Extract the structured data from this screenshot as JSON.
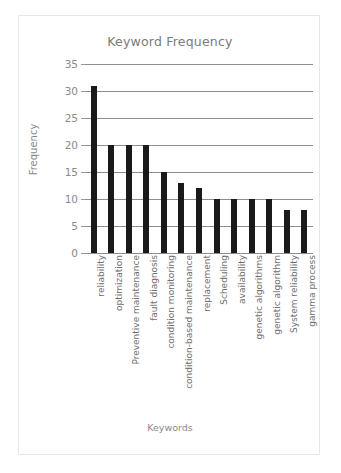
{
  "chart_data": {
    "type": "bar",
    "title": "Keyword Frequency",
    "xlabel": "Keywords",
    "ylabel": "Frequency",
    "categories": [
      "reliability",
      "optimization",
      "Preventive maintenance",
      "fault diagnosis",
      "condition monitoring",
      "condition-based maintenance",
      "replacement",
      "Scheduling",
      "availability",
      "genetic algorithms",
      "genetic algorithm",
      "System reliability",
      "gamma process"
    ],
    "values": [
      31,
      20,
      20,
      20,
      15,
      13,
      12,
      10,
      10,
      10,
      10,
      8,
      8
    ],
    "ylim": [
      0,
      35
    ],
    "yticks": [
      0,
      5,
      10,
      15,
      20,
      25,
      30,
      35
    ],
    "ytick_labels": [
      "0",
      "5",
      "10",
      "15",
      "20",
      "25",
      "30",
      "35"
    ],
    "grid": true,
    "legend": false,
    "bar_color": "#1a1a1a",
    "grid_color": "#8d8d8d",
    "text_color": "#7a7a7a",
    "background": "#ffffff"
  }
}
